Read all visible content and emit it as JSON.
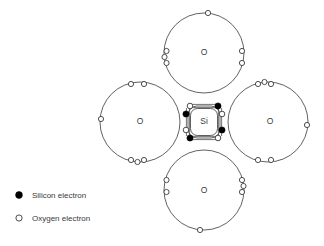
{
  "diagram": {
    "center_atom": {
      "label": "Si",
      "name": "silicon",
      "cx": 204,
      "cy": 122
    },
    "oxygen_atoms": [
      {
        "label": "O",
        "position": "top",
        "cx": 204,
        "cy": 53,
        "r": 40
      },
      {
        "label": "O",
        "position": "right",
        "cx": 268,
        "cy": 122,
        "r": 40
      },
      {
        "label": "O",
        "position": "bottom",
        "cx": 204,
        "cy": 190,
        "r": 40
      },
      {
        "label": "O",
        "position": "left",
        "cx": 140,
        "cy": 122,
        "r": 40
      }
    ],
    "electron_colors": {
      "silicon_fill": "#000000",
      "oxygen_fill": "#ffffff",
      "stroke": "#3a3a3a"
    },
    "counts": {
      "silicon_electrons": 4,
      "oxygen_lone_pairs_each": 6,
      "bonds": 4
    }
  },
  "legend": {
    "items": [
      {
        "marker": "filled-dot",
        "label": "Silicon electron"
      },
      {
        "marker": "hollow-circle",
        "label": "Oxygen electron"
      }
    ]
  }
}
